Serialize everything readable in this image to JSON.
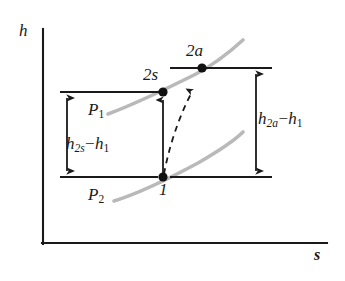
{
  "figure": {
    "type": "thermodynamic-h-s-diagram",
    "axes": {
      "y_label": "h",
      "x_label": "s",
      "y_axis_name": "enthalpy-axis",
      "x_axis_name": "entropy-axis"
    },
    "points": [
      {
        "id": "1",
        "label": "1",
        "x": 163,
        "y": 177
      },
      {
        "id": "2s",
        "label": "2s",
        "x": 163,
        "y": 92
      },
      {
        "id": "2a",
        "label": "2a",
        "x": 202,
        "y": 68
      }
    ],
    "isobars": [
      {
        "id": "P1",
        "label": "P",
        "sub": "1",
        "color": "#b5b5b5"
      },
      {
        "id": "P2",
        "label": "P",
        "sub": "2",
        "color": "#b5b5b5"
      }
    ],
    "dimensions": [
      {
        "id": "h2s-h1",
        "base": "h",
        "sub": "2s",
        "op": "−",
        "term2": "h",
        "term2_sub": "1",
        "side": "left"
      },
      {
        "id": "h2a-h1",
        "base": "h",
        "sub": "2a",
        "op": "−",
        "term2": "h",
        "term2_sub": "1",
        "side": "right"
      }
    ],
    "processes": [
      {
        "id": "isentropic",
        "from": "1",
        "to": "2s",
        "style": "solid-arrow"
      },
      {
        "id": "actual",
        "from": "1",
        "to": "2a",
        "style": "dashed-arrow"
      }
    ],
    "colors": {
      "line": "#1a1a1a",
      "isobar": "#b5b5b5",
      "background": "#ffffff",
      "text": "#1a1a1a"
    }
  }
}
